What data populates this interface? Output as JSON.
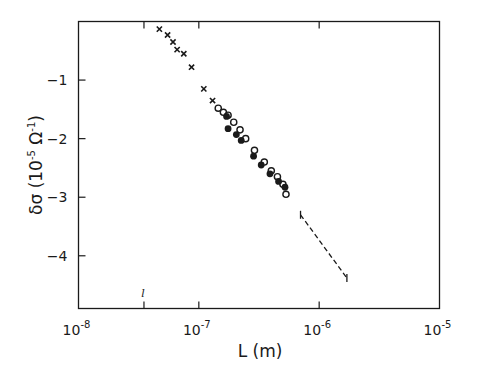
{
  "chart_data": {
    "type": "scatter",
    "title": "",
    "xlabel": "L (m)",
    "ylabel": "δσ (10⁻⁵ Ω⁻¹)",
    "xscale": "log",
    "xlim": [
      1e-08,
      1e-05
    ],
    "ylim": [
      -4.9,
      0
    ],
    "x_ticks": [
      {
        "value": 1e-08,
        "base": "10",
        "exp": "-8"
      },
      {
        "value": 1e-07,
        "base": "10",
        "exp": "-7"
      },
      {
        "value": 1e-06,
        "base": "10",
        "exp": "-6"
      },
      {
        "value": 1e-05,
        "base": "10",
        "exp": "-5"
      }
    ],
    "y_ticks": [
      -1,
      -2,
      -3,
      -4
    ],
    "grid": false,
    "legend": null,
    "annotations": [
      {
        "text": "l",
        "x": 3.5e-08,
        "note": "marker at mean free path on x-axis"
      }
    ],
    "series": [
      {
        "name": "crosses",
        "marker": "x",
        "points": [
          {
            "x": 4.7e-08,
            "y": -0.13
          },
          {
            "x": 5.5e-08,
            "y": -0.23
          },
          {
            "x": 6.1e-08,
            "y": -0.35
          },
          {
            "x": 6.6e-08,
            "y": -0.48
          },
          {
            "x": 7.5e-08,
            "y": -0.55
          },
          {
            "x": 8.7e-08,
            "y": -0.78
          },
          {
            "x": 1.1e-07,
            "y": -1.15
          },
          {
            "x": 1.3e-07,
            "y": -1.35
          }
        ]
      },
      {
        "name": "open circles",
        "marker": "open-circle",
        "points": [
          {
            "x": 1.45e-07,
            "y": -1.48
          },
          {
            "x": 1.6e-07,
            "y": -1.55
          },
          {
            "x": 1.75e-07,
            "y": -1.6
          },
          {
            "x": 1.95e-07,
            "y": -1.72
          },
          {
            "x": 2.2e-07,
            "y": -1.85
          },
          {
            "x": 2.45e-07,
            "y": -2.0
          },
          {
            "x": 2.9e-07,
            "y": -2.2
          },
          {
            "x": 3.5e-07,
            "y": -2.4
          },
          {
            "x": 4e-07,
            "y": -2.55
          },
          {
            "x": 4.5e-07,
            "y": -2.65
          },
          {
            "x": 5e-07,
            "y": -2.78
          },
          {
            "x": 5.3e-07,
            "y": -2.95
          }
        ]
      },
      {
        "name": "filled circles",
        "marker": "filled-circle",
        "points": [
          {
            "x": 1.7e-07,
            "y": -1.62
          },
          {
            "x": 1.75e-07,
            "y": -1.83
          },
          {
            "x": 2.05e-07,
            "y": -1.93
          },
          {
            "x": 2.25e-07,
            "y": -2.03
          },
          {
            "x": 2.85e-07,
            "y": -2.3
          },
          {
            "x": 3.3e-07,
            "y": -2.45
          },
          {
            "x": 3.9e-07,
            "y": -2.6
          },
          {
            "x": 4.6e-07,
            "y": -2.73
          },
          {
            "x": 5.2e-07,
            "y": -2.83
          }
        ]
      },
      {
        "name": "dashed extrapolation",
        "marker": "dashed-line",
        "points": [
          {
            "x": 7e-07,
            "y": -3.3
          },
          {
            "x": 1.7e-06,
            "y": -4.38
          }
        ]
      }
    ]
  }
}
